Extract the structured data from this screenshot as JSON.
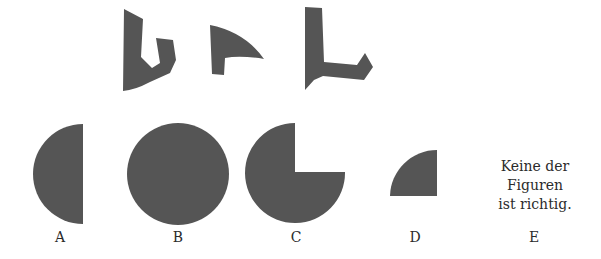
{
  "puzzle": {
    "shape_color": "#555555",
    "pieces": [
      {
        "id": "piece-1",
        "description": "jagged curved piece"
      },
      {
        "id": "piece-2",
        "description": "curved hook piece"
      },
      {
        "id": "piece-3",
        "description": "L-shaped piece"
      }
    ],
    "options": [
      {
        "label": "A",
        "shape": "half-circle"
      },
      {
        "label": "B",
        "shape": "full-circle"
      },
      {
        "label": "C",
        "shape": "three-quarter-circle"
      },
      {
        "label": "D",
        "shape": "quarter-circle"
      },
      {
        "label": "E",
        "text_lines": [
          "Keine der",
          "Figuren",
          "ist richtig."
        ]
      }
    ]
  }
}
